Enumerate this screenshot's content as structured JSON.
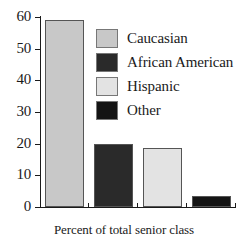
{
  "chart_data": {
    "type": "bar",
    "title": "",
    "subtitle": "",
    "xlabel": "Percent of total senior class",
    "ylabel": "",
    "categories": [
      "Caucasian",
      "African American",
      "Hispanic",
      "Other"
    ],
    "values": [
      59,
      20,
      18.5,
      3.5
    ],
    "series": [
      {
        "name": "Percent of total senior class",
        "values": [
          59,
          20,
          18.5,
          3.5
        ]
      }
    ],
    "ylim": [
      0,
      60
    ],
    "yticks": [
      0,
      10,
      20,
      30,
      40,
      50,
      60
    ],
    "ytick_labels": [
      "0",
      "10",
      "20",
      "30",
      "40",
      "50",
      "60"
    ],
    "grid": false,
    "legend_position": "upper-right-inside",
    "legend": [
      {
        "label": "Caucasian",
        "color": "#c8c8c8"
      },
      {
        "label": "African American",
        "color": "#2a2a2a"
      },
      {
        "label": "Hispanic",
        "color": "#e3e3e3"
      },
      {
        "label": "Other",
        "color": "#141414"
      }
    ],
    "bar_colors": [
      "#c8c8c8",
      "#2a2a2a",
      "#e3e3e3",
      "#141414"
    ],
    "axis_color": "#1a1a1a"
  }
}
